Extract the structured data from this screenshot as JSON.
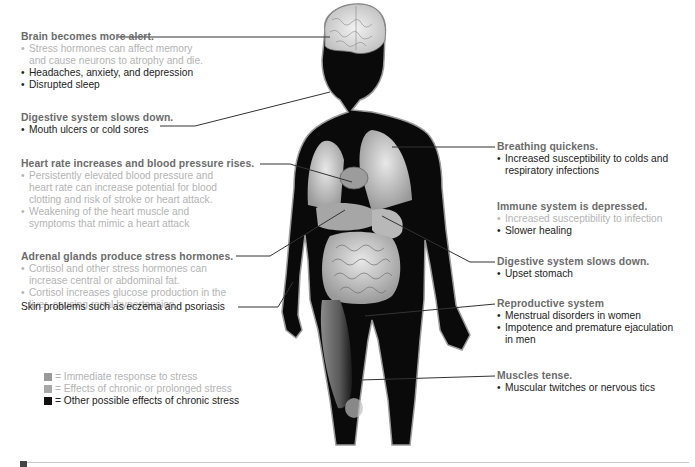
{
  "colors": {
    "heading": "#6b6b6b",
    "immediate": "#b3b3b3",
    "chronic": "#222222",
    "legend_immediate": "#9a9a9a",
    "legend_chronic": "#a8a8a8",
    "legend_other": "#111111",
    "body": "#0a0a0a"
  },
  "left": {
    "brain": {
      "heading": "Brain becomes more alert.",
      "items": [
        {
          "text": "Stress hormones can affect memory",
          "type": "immediate"
        },
        {
          "text": "and cause neurons to atrophy and die.",
          "type": "immediate",
          "cont": true
        },
        {
          "text": "Headaches, anxiety, and depression",
          "type": "chronic"
        },
        {
          "text": "Disrupted sleep",
          "type": "chronic"
        }
      ]
    },
    "digestive_top": {
      "heading": "Digestive system slows down.",
      "items": [
        {
          "text": "Mouth ulcers or cold sores",
          "type": "chronic"
        }
      ]
    },
    "heart": {
      "heading": "Heart rate increases and blood pressure rises.",
      "items": [
        {
          "text": "Persistently elevated blood pressure and",
          "type": "immediate"
        },
        {
          "text": "heart rate can increase potential for blood",
          "type": "immediate",
          "cont": true
        },
        {
          "text": "clotting and risk of stroke or heart attack.",
          "type": "immediate",
          "cont": true
        },
        {
          "text": "Weakening of the heart muscle and",
          "type": "immediate"
        },
        {
          "text": "symptoms that mimic a heart attack",
          "type": "immediate",
          "cont": true
        }
      ]
    },
    "adrenal": {
      "heading": "Adrenal glands produce stress hormones.",
      "items": [
        {
          "text": "Cortisol and other stress hormones can",
          "type": "immediate"
        },
        {
          "text": "increase central or abdominal fat.",
          "type": "immediate",
          "cont": true
        },
        {
          "text": "Cortisol increases glucose production in the",
          "type": "immediate"
        },
        {
          "text": "liver, causing renal hypertension.",
          "type": "immediate",
          "cont": true
        }
      ]
    },
    "skin": {
      "text": "Skin problems such as eczema and psoriasis"
    }
  },
  "right": {
    "breathing": {
      "heading": "Breathing quickens.",
      "items": [
        {
          "text": "Increased susceptibility to colds and",
          "type": "chronic"
        },
        {
          "text": "respiratory infections",
          "type": "chronic",
          "cont": true
        }
      ]
    },
    "immune": {
      "heading": "Immune system is depressed.",
      "items": [
        {
          "text": "Increased susceptibility to infection",
          "type": "immediate"
        },
        {
          "text": "Slower healing",
          "type": "chronic"
        }
      ]
    },
    "digestive_bottom": {
      "heading": "Digestive system slows down.",
      "items": [
        {
          "text": "Upset stomach",
          "type": "chronic"
        }
      ]
    },
    "reproductive": {
      "heading": "Reproductive system",
      "items": [
        {
          "text": "Menstrual disorders in women",
          "type": "chronic"
        },
        {
          "text": "Impotence and premature ejaculation",
          "type": "chronic"
        },
        {
          "text": "in men",
          "type": "chronic",
          "cont": true
        }
      ]
    },
    "muscles": {
      "heading": "Muscles tense.",
      "items": [
        {
          "text": "Muscular twitches or nervous tics",
          "type": "chronic"
        }
      ]
    }
  },
  "legend": [
    {
      "swatch": "legend_immediate",
      "equals": "=",
      "text": "Immediate response to stress",
      "type": "immediate"
    },
    {
      "swatch": "legend_chronic",
      "equals": "=",
      "text": "Effects of chronic or prolonged stress",
      "type": "immediate"
    },
    {
      "swatch": "legend_other",
      "equals": "=",
      "text": "Other possible effects of chronic stress",
      "type": "chronic"
    }
  ]
}
